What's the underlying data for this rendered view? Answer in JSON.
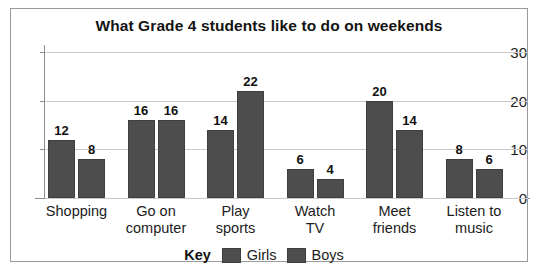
{
  "chart_data": {
    "type": "bar",
    "title": "What Grade 4 students like to do on weekends",
    "xlabel": "",
    "ylabel": "",
    "ylim": [
      0,
      30
    ],
    "yticks": [
      0,
      10,
      20,
      30
    ],
    "grid": true,
    "legend_position": "bottom",
    "legend_title": "Key",
    "categories": [
      "Shopping",
      "Go on computer",
      "Play sports",
      "Watch TV",
      "Meet friends",
      "Listen to music"
    ],
    "category_lines": [
      [
        "Shopping",
        ""
      ],
      [
        "Go on",
        "computer"
      ],
      [
        "Play",
        "sports"
      ],
      [
        "Watch",
        "TV"
      ],
      [
        "Meet",
        "friends"
      ],
      [
        "Listen to",
        "music"
      ]
    ],
    "series": [
      {
        "name": "Girls",
        "color": "#4d4d4d",
        "values": [
          12,
          16,
          14,
          6,
          20,
          8
        ]
      },
      {
        "name": "Boys",
        "color": "#4d4d4d",
        "values": [
          8,
          16,
          22,
          4,
          14,
          6
        ]
      }
    ]
  },
  "colors": {
    "bar": "#4d4d4d",
    "bar_border": "#3f3f3f",
    "grid": "#c9c9c9",
    "axis": "#8d8d8d",
    "frame": "#9a9a9a",
    "text": "#1c1c1c",
    "background": "#ffffff"
  }
}
